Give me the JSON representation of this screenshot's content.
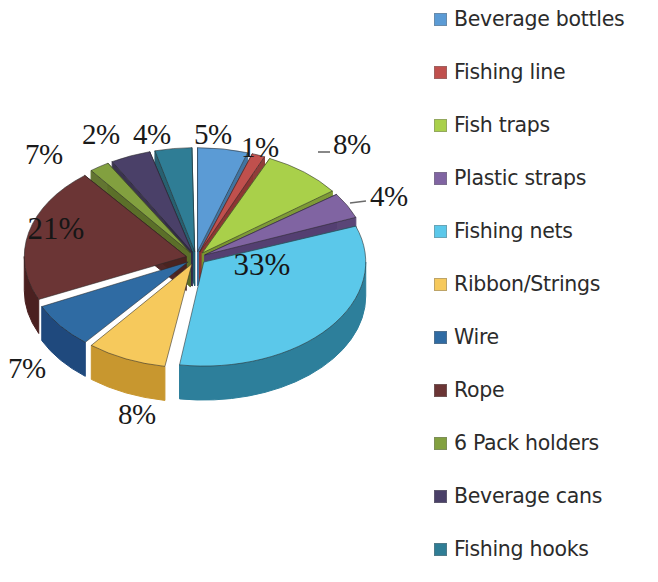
{
  "chart_data": {
    "type": "pie",
    "title": "",
    "subtitle": "",
    "xlabel": "",
    "ylabel": "",
    "grid": false,
    "legend_position": "right",
    "exploded": true,
    "three_d": true,
    "units": "percent",
    "categories": [
      "Beverage bottles",
      "Fishing line",
      "Fish traps",
      "Plastic straps",
      "Fishing nets",
      "Ribbon/Strings",
      "Wire",
      "Rope",
      "6 Pack holders",
      "Beverage cans",
      "Fishing hooks"
    ],
    "values": [
      5,
      1,
      8,
      4,
      33,
      8,
      7,
      21,
      2,
      4,
      5
    ],
    "value_labels": [
      "5%",
      "1%",
      "8%",
      "4%",
      "33%",
      "8%",
      "7%",
      "21%",
      "2%",
      "4%",
      "5%"
    ],
    "colors": [
      "#4f81bd",
      "#c0504d",
      "#9bbb59",
      "#8064a2",
      "#4bacc6",
      "#f79646",
      "#1f497d",
      "#4f2020",
      "#77933c",
      "#4a452a",
      "#2c6a7a"
    ]
  },
  "pie": {
    "slices": [
      {
        "name": "Beverage bottles",
        "value": 5,
        "label": "5%",
        "fill": "#5b9bd5",
        "side": "#3a6f9e",
        "start": 0,
        "end": 18,
        "explode": 10,
        "show_label": false
      },
      {
        "name": "Fishing line",
        "value": 1,
        "label": "1%",
        "fill": "#c0504d",
        "side": "#8d3533",
        "start": 19,
        "end": 23.6,
        "explode": 10,
        "show_label": false
      },
      {
        "name": "Fish traps",
        "value": 8,
        "label": "8%",
        "fill": "#a9d04a",
        "side": "#79962f",
        "start": 24.6,
        "end": 53.4,
        "explode": 10,
        "show_label": false
      },
      {
        "name": "Plastic straps",
        "value": 4,
        "label": "4%",
        "fill": "#8064a2",
        "side": "#543f72",
        "start": 54.4,
        "end": 68.8,
        "explode": 10,
        "show_label": false
      },
      {
        "name": "Fishing nets",
        "value": 33,
        "label": "33%",
        "fill": "#5bc8ea",
        "side": "#2d7f9b",
        "start": 69.8,
        "end": 188.6,
        "explode": 10,
        "show_label": true,
        "label_x": 262,
        "label_y": 275
      },
      {
        "name": "Ribbon/Strings",
        "value": 8,
        "label": "8%",
        "fill": "#f6c95c",
        "side": "#c8972f",
        "start": 189.6,
        "end": 218.4,
        "explode": 10,
        "show_label": false
      },
      {
        "name": "Wire",
        "value": 7,
        "label": "7%",
        "fill": "#2f6ba3",
        "side": "#1f497d",
        "start": 219.4,
        "end": 244.6,
        "explode": 10,
        "show_label": false
      },
      {
        "name": "Rope",
        "value": 21,
        "label": "21%",
        "fill": "#6b3535",
        "side": "#4a2020",
        "start": 245.6,
        "end": 321.2,
        "explode": 10,
        "show_label": true,
        "label_x": 56,
        "label_y": 239
      },
      {
        "name": "6 Pack holders",
        "value": 2,
        "label": "2%",
        "fill": "#82a03f",
        "side": "#5c7029",
        "start": 322.2,
        "end": 329.4,
        "explode": 10,
        "show_label": false
      },
      {
        "name": "Beverage cans",
        "value": 4,
        "label": "4%",
        "fill": "#4a4068",
        "side": "#322b48",
        "start": 330.4,
        "end": 344.8,
        "explode": 10,
        "show_label": false
      },
      {
        "name": "Fishing hooks",
        "value": 5,
        "label": "5%",
        "fill": "#2f7d95",
        "side": "#1f5a6b",
        "start": 345.8,
        "end": 359.0,
        "explode": 10,
        "show_label": false
      }
    ],
    "outside_labels": [
      {
        "name": "wire-label",
        "text": "7%",
        "x": 8,
        "y": 352,
        "size": 29
      },
      {
        "name": "six-pack-label",
        "text": "2%",
        "x": 82,
        "y": 118,
        "size": 29
      },
      {
        "name": "beverage-cans-label",
        "text": "4%",
        "x": 133,
        "y": 118,
        "size": 29
      },
      {
        "name": "fishing-hooks-label",
        "text": "5%",
        "x": 194,
        "y": 118,
        "size": 29
      },
      {
        "name": "rope-outside-label",
        "text": "7%",
        "x": 25,
        "y": 138,
        "size": 29
      },
      {
        "name": "fishing-line-label",
        "text": "1%",
        "x": 241,
        "y": 131,
        "size": 29
      },
      {
        "name": "fish-traps-label",
        "text": "8%",
        "x": 333,
        "y": 128,
        "size": 29
      },
      {
        "name": "plastic-straps-label",
        "text": "4%",
        "x": 370,
        "y": 180,
        "size": 29
      },
      {
        "name": "ribbon-strings-label",
        "text": "8%",
        "x": 118,
        "y": 398,
        "size": 29
      }
    ],
    "leaders": [
      {
        "name": "fish-traps-leader",
        "x1": 318,
        "y1": 152,
        "x2": 330,
        "y2": 152
      },
      {
        "name": "plastic-straps-leader",
        "x1": 350,
        "y1": 203,
        "x2": 366,
        "y2": 201
      }
    ]
  },
  "legend": {
    "items": [
      {
        "label": "Beverage bottles",
        "color": "#5b9bd5",
        "y": 6
      },
      {
        "label": "Fishing line",
        "color": "#c0504d",
        "y": 59
      },
      {
        "label": "Fish traps",
        "color": "#a9d04a",
        "y": 112
      },
      {
        "label": "Plastic straps",
        "color": "#8064a2",
        "y": 165
      },
      {
        "label": "Fishing nets",
        "color": "#5bc8ea",
        "y": 218
      },
      {
        "label": "Ribbon/Strings",
        "color": "#f6c95c",
        "y": 271
      },
      {
        "label": "Wire",
        "color": "#2f6ba3",
        "y": 324
      },
      {
        "label": "Rope",
        "color": "#6b3535",
        "y": 377
      },
      {
        "label": "6 Pack holders",
        "color": "#82a03f",
        "y": 430
      },
      {
        "label": "Beverage cans",
        "color": "#4a4068",
        "y": 483
      },
      {
        "label": "Fishing hooks",
        "color": "#2f7d95",
        "y": 536
      }
    ]
  }
}
